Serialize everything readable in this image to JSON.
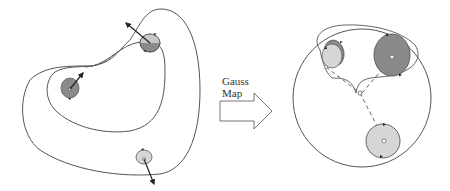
{
  "figure": {
    "arrow_label_line1": "Gauss",
    "arrow_label_line2": "Map",
    "colors": {
      "stroke": "#555555",
      "dark_fill": "#8a8a8a",
      "light_fill": "#d6d6d6",
      "background": "#ffffff"
    },
    "left_panel": {
      "description": "Closed bean-shaped surface region with three marked points and normal vectors",
      "points": [
        {
          "name": "top-right",
          "shade": "dark"
        },
        {
          "name": "middle-left",
          "shade": "dark"
        },
        {
          "name": "bottom",
          "shade": "light"
        }
      ]
    },
    "right_panel": {
      "description": "Unit sphere (Gauss image) with three image regions connected by dashed geodesics",
      "regions": [
        {
          "name": "top-left",
          "shade": "light"
        },
        {
          "name": "top-right",
          "shade": "dark"
        },
        {
          "name": "bottom",
          "shade": "light"
        }
      ]
    }
  }
}
